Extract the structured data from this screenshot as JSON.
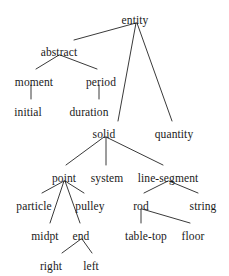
{
  "diagram": {
    "type": "tree",
    "stroke_color": "#3a3a3a",
    "text_color": "#1a1a1a",
    "background_color": "#ffffff",
    "nodes": [
      {
        "id": "entity",
        "label": "entity",
        "x": 135,
        "y": 14,
        "parent": null
      },
      {
        "id": "abstract",
        "label": "abstract",
        "x": 59,
        "y": 46,
        "parent": "entity"
      },
      {
        "id": "moment",
        "label": "moment",
        "x": 34,
        "y": 76,
        "parent": "abstract"
      },
      {
        "id": "period",
        "label": "period",
        "x": 101,
        "y": 76,
        "parent": "abstract"
      },
      {
        "id": "initial",
        "label": "initial",
        "x": 28,
        "y": 106,
        "parent": "moment"
      },
      {
        "id": "duration",
        "label": "duration",
        "x": 89,
        "y": 106,
        "parent": "period"
      },
      {
        "id": "solid",
        "label": "solid",
        "x": 104,
        "y": 128,
        "parent": "entity"
      },
      {
        "id": "quantity",
        "label": "quantity",
        "x": 174,
        "y": 128,
        "parent": "entity"
      },
      {
        "id": "point",
        "label": "point",
        "x": 64,
        "y": 172,
        "parent": "solid"
      },
      {
        "id": "system",
        "label": "system",
        "x": 107,
        "y": 172,
        "parent": "solid"
      },
      {
        "id": "line-segment",
        "label": "line-segment",
        "x": 168,
        "y": 172,
        "parent": "solid"
      },
      {
        "id": "particle",
        "label": "particle",
        "x": 34,
        "y": 200,
        "parent": "point"
      },
      {
        "id": "pulley",
        "label": "pulley",
        "x": 90,
        "y": 200,
        "parent": "point"
      },
      {
        "id": "rod",
        "label": "rod",
        "x": 141,
        "y": 200,
        "parent": "line-segment"
      },
      {
        "id": "string",
        "label": "string",
        "x": 203,
        "y": 200,
        "parent": "line-segment"
      },
      {
        "id": "midpt",
        "label": "midpt",
        "x": 45,
        "y": 230,
        "parent": "point"
      },
      {
        "id": "end",
        "label": "end",
        "x": 81,
        "y": 230,
        "parent": "point"
      },
      {
        "id": "table-top",
        "label": "table-top",
        "x": 146,
        "y": 230,
        "parent": "rod"
      },
      {
        "id": "floor",
        "label": "floor",
        "x": 193,
        "y": 230,
        "parent": "rod"
      },
      {
        "id": "right",
        "label": "right",
        "x": 51,
        "y": 260,
        "parent": "end"
      },
      {
        "id": "left",
        "label": "left",
        "x": 91,
        "y": 260,
        "parent": "end"
      }
    ],
    "edges": [
      {
        "from": "entity",
        "to": "abstract",
        "x1": 136,
        "y1": 23,
        "x2": 74,
        "y2": 40
      },
      {
        "from": "entity",
        "to": "solid",
        "x1": 136,
        "y1": 23,
        "x2": 118,
        "y2": 121
      },
      {
        "from": "entity",
        "to": "quantity",
        "x1": 137,
        "y1": 23,
        "x2": 172,
        "y2": 121
      },
      {
        "from": "abstract",
        "to": "moment",
        "x1": 59,
        "y1": 55,
        "x2": 36,
        "y2": 69
      },
      {
        "from": "abstract",
        "to": "period",
        "x1": 60,
        "y1": 55,
        "x2": 97,
        "y2": 69
      },
      {
        "from": "moment",
        "to": "initial",
        "x1": 31,
        "y1": 85,
        "x2": 31,
        "y2": 99
      },
      {
        "from": "period",
        "to": "duration",
        "x1": 99,
        "y1": 85,
        "x2": 99,
        "y2": 99
      },
      {
        "from": "solid",
        "to": "point",
        "x1": 104,
        "y1": 137,
        "x2": 66,
        "y2": 165
      },
      {
        "from": "solid",
        "to": "system",
        "x1": 106,
        "y1": 137,
        "x2": 106,
        "y2": 165
      },
      {
        "from": "solid",
        "to": "line-segment",
        "x1": 106,
        "y1": 137,
        "x2": 163,
        "y2": 165
      },
      {
        "from": "point",
        "to": "particle",
        "x1": 64,
        "y1": 181,
        "x2": 42,
        "y2": 193
      },
      {
        "from": "point",
        "to": "pulley",
        "x1": 65,
        "y1": 181,
        "x2": 84,
        "y2": 193
      },
      {
        "from": "point",
        "to": "midpt",
        "x1": 64,
        "y1": 181,
        "x2": 50,
        "y2": 223
      },
      {
        "from": "point",
        "to": "end",
        "x1": 65,
        "y1": 181,
        "x2": 80,
        "y2": 223
      },
      {
        "from": "line-segment",
        "to": "rod",
        "x1": 168,
        "y1": 181,
        "x2": 144,
        "y2": 193
      },
      {
        "from": "line-segment",
        "to": "string",
        "x1": 169,
        "y1": 181,
        "x2": 198,
        "y2": 193
      },
      {
        "from": "rod",
        "to": "table-top",
        "x1": 141,
        "y1": 209,
        "x2": 141,
        "y2": 223
      },
      {
        "from": "rod",
        "to": "floor",
        "x1": 142,
        "y1": 209,
        "x2": 190,
        "y2": 223
      },
      {
        "from": "end",
        "to": "right",
        "x1": 81,
        "y1": 239,
        "x2": 62,
        "y2": 253
      },
      {
        "from": "end",
        "to": "left",
        "x1": 82,
        "y1": 239,
        "x2": 92,
        "y2": 253
      }
    ]
  }
}
